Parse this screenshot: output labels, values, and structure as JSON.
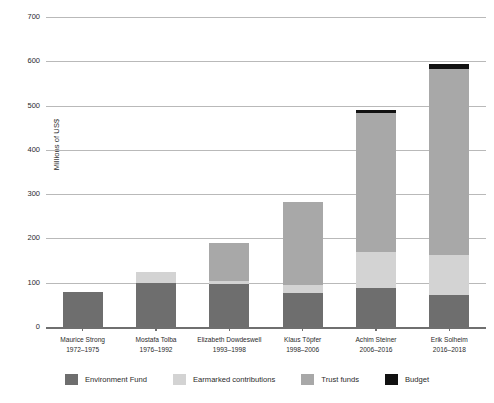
{
  "chart_data": {
    "type": "bar",
    "subtype": "stacked-vertical",
    "title": "",
    "xlabel": "",
    "ylabel": "Millions of US$",
    "ylim": [
      0,
      700
    ],
    "yticks": [
      0,
      100,
      200,
      300,
      400,
      500,
      600,
      700
    ],
    "ytick_labels": [
      "0",
      "100",
      "200",
      "300",
      "400",
      "500",
      "600",
      "700"
    ],
    "grid": true,
    "legend_position": "bottom",
    "categories": [
      "Maurice Strong",
      "Mostafa Tolba",
      "Elizabeth Dowdeswell",
      "Klaus Töpfer",
      "Achim Steiner",
      "Erik Solheim"
    ],
    "category_sublabels": [
      "1972–1975",
      "1976–1992",
      "1993–1998",
      "1998–2006",
      "2006–2016",
      "2016–2018"
    ],
    "series": [
      {
        "name": "Environment Fund",
        "color": "#6e6e6e",
        "values": [
          80,
          100,
          98,
          77,
          88,
          72
        ]
      },
      {
        "name": "Earmarked contributions",
        "color": "#d3d3d3",
        "values": [
          0,
          25,
          7,
          18,
          82,
          90
        ]
      },
      {
        "name": "Trust funds",
        "color": "#a8a8a8",
        "values": [
          0,
          0,
          85,
          188,
          313,
          420
        ]
      },
      {
        "name": "Budget",
        "color": "#111111",
        "values": [
          0,
          0,
          0,
          0,
          7,
          13
        ]
      }
    ],
    "totals": [
      80,
      125,
      190,
      283,
      490,
      595
    ]
  },
  "axis": {
    "y_title": "Millions of US$"
  },
  "legend": {
    "items": [
      {
        "label": "Environment Fund",
        "color": "#6e6e6e"
      },
      {
        "label": "Earmarked contributions",
        "color": "#d3d3d3"
      },
      {
        "label": "Trust funds",
        "color": "#a8a8a8"
      },
      {
        "label": "Budget",
        "color": "#111111"
      }
    ]
  },
  "colors": {
    "gridline": "#b9b9b9",
    "axis": "#6f6f6f",
    "text": "#2b2b2b",
    "background": "#ffffff"
  }
}
